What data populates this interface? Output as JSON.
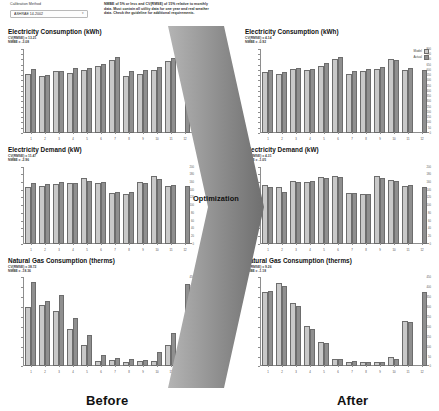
{
  "controls": {
    "calibration_label": "Calibration Method",
    "calibration_value": "ASHRAE 14-2002",
    "caret_icon": "chevron-down-icon",
    "guidance_text": "NMBE of 5% or less and CV(RMSE) of 15% relative to monthly data. Must contain all utility data for one year and real weather data. Check the guideline for additional requirements."
  },
  "legend": {
    "model_label": "Model",
    "actual_label": "Actual",
    "model_color": "#c9c9c9",
    "actual_color": "#8f8f8f"
  },
  "flow": {
    "arrow_label": "Optimization",
    "arrow_color": "#9a9a9a"
  },
  "captions": {
    "before": "Before",
    "after": "After"
  },
  "chart_data": [
    {
      "id": "elec-consumption-before",
      "side": "Before",
      "type": "bar",
      "title": "Electricity Consumption (kWh)",
      "cvrmse_label": "CV(RMSE) = 13.21",
      "nmbe_label": "NMBE = -3.08",
      "xlabel": "",
      "ylabel": "kWh",
      "categories": [
        "1",
        "2",
        "3",
        "4",
        "5",
        "6",
        "7",
        "8",
        "9",
        "10",
        "11",
        "12"
      ],
      "ylim": [
        0,
        800
      ],
      "yticks": [
        0,
        50,
        100,
        150,
        200,
        250,
        300,
        350,
        400,
        450,
        500,
        550,
        600,
        650,
        700,
        750,
        800
      ],
      "grid": false,
      "legend_position": "none",
      "series": [
        {
          "name": "Model",
          "values": [
            560,
            540,
            590,
            570,
            600,
            640,
            690,
            540,
            560,
            600,
            680,
            0
          ]
        },
        {
          "name": "Actual",
          "values": [
            605,
            555,
            585,
            620,
            615,
            660,
            720,
            585,
            595,
            630,
            715,
            600
          ]
        }
      ]
    },
    {
      "id": "elec-demand-before",
      "side": "Before",
      "type": "bar",
      "title": "Electricity Demand (kW)",
      "cvrmse_label": "CV(RMSE) = 11.47",
      "nmbe_label": "NMBE = -2.96",
      "xlabel": "",
      "ylabel": "kW",
      "categories": [
        "1",
        "2",
        "3",
        "4",
        "5",
        "6",
        "7",
        "8",
        "9",
        "10",
        "11",
        "12"
      ],
      "ylim": [
        0,
        200
      ],
      "yticks": [
        0,
        20,
        40,
        60,
        80,
        100,
        120,
        140,
        160,
        180,
        200
      ],
      "grid": false,
      "legend_position": "none",
      "series": [
        {
          "name": "Model",
          "values": [
            148,
            150,
            155,
            157,
            170,
            157,
            132,
            130,
            160,
            175,
            150,
            0
          ]
        },
        {
          "name": "Actual",
          "values": [
            158,
            154,
            160,
            158,
            162,
            160,
            135,
            135,
            158,
            168,
            152,
            150
          ]
        }
      ]
    },
    {
      "id": "gas-consumption-before",
      "side": "Before",
      "type": "bar",
      "title": "Natural Gas Consumption (therms)",
      "cvrmse_label": "CV(RMSE) = 38.72",
      "nmbe_label": "NMBE = -18.36",
      "xlabel": "",
      "ylabel": "therms",
      "categories": [
        "1",
        "2",
        "3",
        "4",
        "5",
        "6",
        "7",
        "8",
        "9",
        "10",
        "11",
        "12"
      ],
      "ylim": [
        0,
        450
      ],
      "yticks": [
        0,
        50,
        100,
        150,
        200,
        250,
        300,
        350,
        400,
        450
      ],
      "grid": false,
      "legend_position": "none",
      "series": [
        {
          "name": "Model",
          "values": [
            300,
            310,
            280,
            190,
            110,
            30,
            35,
            25,
            30,
            30,
            110,
            0
          ]
        },
        {
          "name": "Actual",
          "values": [
            425,
            330,
            360,
            245,
            160,
            60,
            45,
            40,
            35,
            75,
            170,
            415
          ]
        }
      ]
    },
    {
      "id": "elec-consumption-after",
      "side": "After",
      "type": "bar",
      "title": "Electricity Consumption (kWh)",
      "cvrmse_label": "CV(RMSE) = 4.14",
      "nmbe_label": "NMBE = -0.92",
      "xlabel": "",
      "ylabel": "kWh",
      "categories": [
        "1",
        "2",
        "3",
        "4",
        "5",
        "6",
        "7",
        "8",
        "9",
        "10",
        "11",
        "12"
      ],
      "ylim": [
        0,
        800
      ],
      "yticks": [
        0,
        50,
        100,
        150,
        200,
        250,
        300,
        350,
        400,
        450,
        500,
        550,
        600,
        650,
        700,
        750,
        800
      ],
      "grid": false,
      "legend_position": "top-right",
      "series": [
        {
          "name": "Model",
          "values": [
            580,
            560,
            610,
            595,
            640,
            700,
            560,
            590,
            610,
            700,
            600,
            0
          ]
        },
        {
          "name": "Actual",
          "values": [
            600,
            575,
            615,
            610,
            665,
            720,
            585,
            605,
            625,
            690,
            620,
            600
          ]
        }
      ]
    },
    {
      "id": "elec-demand-after",
      "side": "After",
      "type": "bar",
      "title": "Electricity Demand (kW)",
      "cvrmse_label": "CV(RMSE) = 4.31",
      "nmbe_label": "NMBE = -1.05",
      "xlabel": "",
      "ylabel": "kW",
      "categories": [
        "1",
        "2",
        "3",
        "4",
        "5",
        "6",
        "7",
        "8",
        "9",
        "10",
        "11",
        "12"
      ],
      "ylim": [
        0,
        200
      ],
      "yticks": [
        0,
        20,
        40,
        60,
        80,
        100,
        120,
        140,
        160,
        180,
        200
      ],
      "grid": false,
      "legend_position": "none",
      "series": [
        {
          "name": "Model",
          "values": [
            152,
            148,
            163,
            160,
            172,
            175,
            132,
            130,
            175,
            165,
            150,
            0
          ]
        },
        {
          "name": "Actual",
          "values": [
            146,
            135,
            160,
            162,
            170,
            172,
            131,
            129,
            170,
            162,
            152,
            148
          ]
        }
      ]
    },
    {
      "id": "gas-consumption-after",
      "side": "After",
      "type": "bar",
      "title": "Natural Gas Consumption (therms)",
      "cvrmse_label": "CV(RMSE) = 9.26",
      "nmbe_label": "NMBE = -1.18",
      "xlabel": "",
      "ylabel": "therms",
      "categories": [
        "1",
        "2",
        "3",
        "4",
        "5",
        "6",
        "7",
        "8",
        "9",
        "10",
        "11",
        "12"
      ],
      "ylim": [
        0,
        450
      ],
      "yticks": [
        0,
        50,
        100,
        150,
        200,
        250,
        300,
        350,
        400,
        450
      ],
      "grid": false,
      "legend_position": "none",
      "series": [
        {
          "name": "Model",
          "values": [
            375,
            420,
            320,
            205,
            125,
            40,
            25,
            22,
            20,
            50,
            230,
            0
          ]
        },
        {
          "name": "Actual",
          "values": [
            380,
            405,
            305,
            190,
            120,
            38,
            28,
            24,
            22,
            40,
            225,
            375
          ]
        }
      ]
    }
  ]
}
